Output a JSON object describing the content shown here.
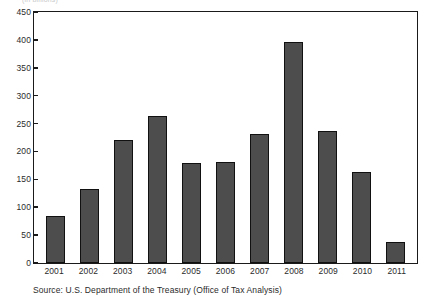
{
  "figure": {
    "top_clipped_text": "(in billions)",
    "source_note": "Source: U.S. Department of the Treasury (Office of Tax Analysis)",
    "bar_color": "#4d4d4d",
    "bar_edge_color": "#111111",
    "axis_color": "#1a1a1a",
    "background": "#ffffff"
  },
  "chart_data": {
    "type": "bar",
    "title": "",
    "xlabel": "",
    "ylabel": "",
    "categories": [
      "2001",
      "2002",
      "2003",
      "2004",
      "2005",
      "2006",
      "2007",
      "2008",
      "2009",
      "2010",
      "2011"
    ],
    "values": [
      85,
      133,
      220,
      264,
      179,
      182,
      232,
      397,
      237,
      164,
      37
    ],
    "ylim": [
      0,
      450
    ],
    "yticks": [
      0,
      50,
      100,
      150,
      200,
      250,
      300,
      350,
      400,
      450
    ],
    "ytick_labels": [
      "0",
      "50",
      "100",
      "150",
      "200",
      "250",
      "300",
      "350",
      "400",
      "450"
    ],
    "grid": false,
    "legend": null,
    "series": [
      {
        "name": "",
        "values": [
          85,
          133,
          220,
          264,
          179,
          182,
          232,
          397,
          237,
          164,
          37
        ]
      }
    ]
  }
}
